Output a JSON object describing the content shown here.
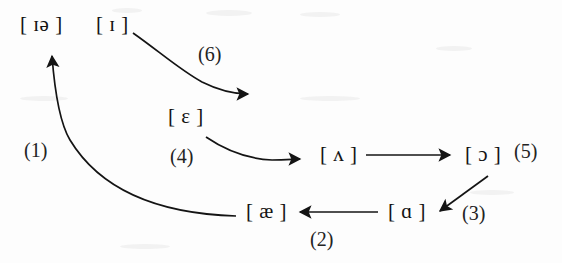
{
  "diagram": {
    "background_color": "#fdfdfd",
    "ink_color": "#141414",
    "nodes": [
      {
        "id": "node-ia",
        "symbol": "[ ɪə ]",
        "x": 20,
        "y": 14
      },
      {
        "id": "node-i",
        "symbol": "[ ɪ ]",
        "x": 96,
        "y": 14
      },
      {
        "id": "node-e",
        "symbol": "[ ɛ ]",
        "x": 168,
        "y": 106
      },
      {
        "id": "node-v",
        "symbol": "[ ʌ ]",
        "x": 320,
        "y": 144
      },
      {
        "id": "node-o",
        "symbol": "[ ɔ ]",
        "x": 465,
        "y": 144
      },
      {
        "id": "node-ae",
        "symbol": "[ æ ]",
        "x": 246,
        "y": 201
      },
      {
        "id": "node-a",
        "symbol": "[ ɑ ]",
        "x": 388,
        "y": 201
      }
    ],
    "labels": [
      {
        "id": "label-1",
        "text": "(1)",
        "x": 24,
        "y": 140
      },
      {
        "id": "label-2",
        "text": "(2)",
        "x": 310,
        "y": 229
      },
      {
        "id": "label-3",
        "text": "(3)",
        "x": 462,
        "y": 203
      },
      {
        "id": "label-4",
        "text": "(4)",
        "x": 170,
        "y": 146
      },
      {
        "id": "label-5",
        "text": "(5)",
        "x": 514,
        "y": 141
      },
      {
        "id": "label-6",
        "text": "(6)",
        "x": 198,
        "y": 44
      }
    ],
    "arrows": [
      {
        "id": "arrow-1",
        "from": "node-ae",
        "to": "node-ia",
        "kind": "curve",
        "label": "(1)"
      },
      {
        "id": "arrow-2",
        "from": "node-a",
        "to": "node-ae",
        "kind": "straight",
        "label": "(2)"
      },
      {
        "id": "arrow-3",
        "from": "node-o",
        "to": "node-a",
        "kind": "straight",
        "label": "(3)"
      },
      {
        "id": "arrow-4",
        "from": "node-e",
        "to": "node-v",
        "kind": "curve",
        "label": "(4)"
      },
      {
        "id": "arrow-5",
        "from": "node-v",
        "to": "node-o",
        "kind": "straight",
        "label": "(5)"
      },
      {
        "id": "arrow-6",
        "from": "node-i",
        "to": "node-e",
        "kind": "curve",
        "label": "(6)"
      }
    ]
  }
}
